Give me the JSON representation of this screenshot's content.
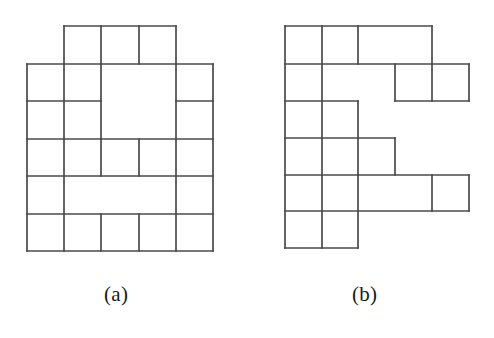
{
  "figure": {
    "kind": "polyomino-tiling-diagram",
    "background_color": "#ffffff",
    "line_color": "#4a4a4a",
    "line_width": 1.7,
    "panels": [
      {
        "id": "a",
        "caption": "(a)",
        "caption_x": 104,
        "caption_y": 282,
        "grid": {
          "cell_size": 37,
          "origin_x": 27,
          "origin_y": 26,
          "columns": 5,
          "rows": 6,
          "column_x": [
            27,
            64,
            101,
            139,
            176,
            213
          ],
          "row_y": [
            26,
            64,
            101,
            139,
            176,
            214,
            251
          ]
        },
        "occupied_cells": [
          [
            0,
            1
          ],
          [
            0,
            2
          ],
          [
            0,
            3
          ],
          [
            1,
            0
          ],
          [
            1,
            1
          ],
          [
            1,
            2
          ],
          [
            1,
            3
          ],
          [
            1,
            4
          ],
          [
            2,
            0
          ],
          [
            2,
            1
          ],
          [
            2,
            2
          ],
          [
            2,
            3
          ],
          [
            2,
            4
          ],
          [
            3,
            0
          ],
          [
            3,
            1
          ],
          [
            3,
            2
          ],
          [
            3,
            3
          ],
          [
            3,
            4
          ],
          [
            4,
            0
          ],
          [
            4,
            1
          ],
          [
            4,
            2
          ],
          [
            4,
            3
          ],
          [
            4,
            4
          ],
          [
            5,
            0
          ],
          [
            5,
            1
          ],
          [
            5,
            2
          ],
          [
            5,
            3
          ],
          [
            5,
            4
          ]
        ],
        "pieces": [
          {
            "name": "top-cell-c1",
            "cells": [
              [
                0,
                1
              ]
            ]
          },
          {
            "name": "top-cell-c2",
            "cells": [
              [
                0,
                2
              ]
            ]
          },
          {
            "name": "top-cell-c3",
            "cells": [
              [
                0,
                3
              ]
            ]
          },
          {
            "name": "left-square-r1c0",
            "cells": [
              [
                1,
                0
              ]
            ]
          },
          {
            "name": "left-square-r1c1",
            "cells": [
              [
                1,
                1
              ]
            ]
          },
          {
            "name": "big-square-r1r2-c2c3",
            "cells": [
              [
                1,
                2
              ],
              [
                1,
                3
              ],
              [
                2,
                2
              ],
              [
                2,
                3
              ]
            ]
          },
          {
            "name": "right-cell-r1c4",
            "cells": [
              [
                1,
                4
              ]
            ]
          },
          {
            "name": "left-square-r2c0",
            "cells": [
              [
                2,
                0
              ]
            ]
          },
          {
            "name": "left-square-r2c1",
            "cells": [
              [
                2,
                1
              ]
            ]
          },
          {
            "name": "right-cell-r2c4",
            "cells": [
              [
                2,
                4
              ]
            ]
          },
          {
            "name": "row3-cell-c0",
            "cells": [
              [
                3,
                0
              ]
            ]
          },
          {
            "name": "row3-cell-c1",
            "cells": [
              [
                3,
                1
              ]
            ]
          },
          {
            "name": "row3-cell-c2",
            "cells": [
              [
                3,
                2
              ]
            ]
          },
          {
            "name": "row3-cell-c3",
            "cells": [
              [
                3,
                3
              ]
            ]
          },
          {
            "name": "row3-cell-c4",
            "cells": [
              [
                3,
                4
              ]
            ]
          },
          {
            "name": "row4-cell-c0",
            "cells": [
              [
                4,
                0
              ]
            ]
          },
          {
            "name": "row4-tromino-c1c2c3",
            "cells": [
              [
                4,
                1
              ],
              [
                4,
                2
              ],
              [
                4,
                3
              ]
            ]
          },
          {
            "name": "row4-cell-c4",
            "cells": [
              [
                4,
                4
              ]
            ]
          },
          {
            "name": "row5-cell-c0",
            "cells": [
              [
                5,
                0
              ]
            ]
          },
          {
            "name": "row5-cell-c1",
            "cells": [
              [
                5,
                1
              ]
            ]
          },
          {
            "name": "row5-cell-c2",
            "cells": [
              [
                5,
                2
              ]
            ]
          },
          {
            "name": "row5-cell-c3",
            "cells": [
              [
                5,
                3
              ]
            ]
          },
          {
            "name": "row5-cell-c4",
            "cells": [
              [
                5,
                4
              ]
            ]
          }
        ],
        "segments": [
          [
            64,
            26,
            176,
            26
          ],
          [
            64,
            26,
            64,
            64
          ],
          [
            101,
            26,
            101,
            64
          ],
          [
            139,
            26,
            139,
            64
          ],
          [
            176,
            26,
            176,
            64
          ],
          [
            27,
            64,
            213,
            64
          ],
          [
            27,
            64,
            27,
            251
          ],
          [
            213,
            64,
            213,
            251
          ],
          [
            64,
            64,
            64,
            139
          ],
          [
            101,
            64,
            101,
            139
          ],
          [
            176,
            64,
            176,
            251
          ],
          [
            27,
            101,
            101,
            101
          ],
          [
            176,
            101,
            213,
            101
          ],
          [
            27,
            139,
            213,
            139
          ],
          [
            64,
            139,
            64,
            251
          ],
          [
            101,
            139,
            101,
            176
          ],
          [
            139,
            139,
            139,
            176
          ],
          [
            27,
            176,
            213,
            176
          ],
          [
            27,
            214,
            213,
            214
          ],
          [
            101,
            214,
            101,
            251
          ],
          [
            139,
            214,
            139,
            251
          ],
          [
            27,
            251,
            213,
            251
          ]
        ]
      },
      {
        "id": "b",
        "caption": "(b)",
        "caption_x": 352,
        "caption_y": 282,
        "grid": {
          "cell_size": 37,
          "origin_x": 285,
          "origin_y": 26,
          "columns": 5,
          "rows": 6,
          "column_x": [
            285,
            322,
            358,
            395,
            432,
            469
          ],
          "row_y": [
            26,
            64,
            101,
            138,
            175,
            211,
            248
          ]
        },
        "occupied_cells": [
          [
            0,
            0
          ],
          [
            0,
            1
          ],
          [
            0,
            2
          ],
          [
            0,
            3
          ],
          [
            1,
            0
          ],
          [
            1,
            1
          ],
          [
            1,
            2
          ],
          [
            1,
            3
          ],
          [
            1,
            4
          ],
          [
            2,
            0
          ],
          [
            2,
            1
          ],
          [
            3,
            0
          ],
          [
            3,
            1
          ],
          [
            3,
            2
          ],
          [
            4,
            0
          ],
          [
            4,
            1
          ],
          [
            4,
            2
          ],
          [
            4,
            3
          ],
          [
            4,
            4
          ],
          [
            5,
            0
          ],
          [
            5,
            1
          ]
        ],
        "pieces": [
          {
            "name": "row0-cell-c0",
            "cells": [
              [
                0,
                0
              ]
            ]
          },
          {
            "name": "row0-cell-c1",
            "cells": [
              [
                0,
                1
              ]
            ]
          },
          {
            "name": "row0-domino-c2c3",
            "cells": [
              [
                0,
                2
              ],
              [
                0,
                3
              ]
            ]
          },
          {
            "name": "row1-domino-c0c1",
            "cells": [
              [
                1,
                0
              ],
              [
                1,
                1
              ]
            ]
          },
          {
            "name": "row1-cell-c3",
            "cells": [
              [
                1,
                3
              ]
            ]
          },
          {
            "name": "row1-cell-c4",
            "cells": [
              [
                1,
                4
              ]
            ]
          },
          {
            "name": "row2-cell-c0",
            "cells": [
              [
                2,
                0
              ]
            ]
          },
          {
            "name": "row2-cell-c1",
            "cells": [
              [
                2,
                1
              ]
            ]
          },
          {
            "name": "row3-cell-c0",
            "cells": [
              [
                3,
                0
              ]
            ]
          },
          {
            "name": "row3-cell-c1",
            "cells": [
              [
                3,
                1
              ]
            ]
          },
          {
            "name": "row3-cell-c2",
            "cells": [
              [
                3,
                2
              ]
            ]
          },
          {
            "name": "row4-cell-c0",
            "cells": [
              [
                4,
                0
              ]
            ]
          },
          {
            "name": "row4-cell-c1",
            "cells": [
              [
                4,
                1
              ]
            ]
          },
          {
            "name": "row4-domino-c2c3",
            "cells": [
              [
                4,
                2
              ],
              [
                4,
                3
              ]
            ]
          },
          {
            "name": "row4-cell-c4",
            "cells": [
              [
                4,
                4
              ]
            ]
          },
          {
            "name": "row5-cell-c0",
            "cells": [
              [
                5,
                0
              ]
            ]
          },
          {
            "name": "row5-cell-c1",
            "cells": [
              [
                5,
                1
              ]
            ]
          }
        ],
        "segments": [
          [
            285,
            26,
            432,
            26
          ],
          [
            285,
            26,
            285,
            248
          ],
          [
            322,
            26,
            322,
            248
          ],
          [
            358,
            26,
            358,
            64
          ],
          [
            432,
            26,
            432,
            64
          ],
          [
            285,
            64,
            469,
            64
          ],
          [
            395,
            64,
            395,
            101
          ],
          [
            432,
            64,
            432,
            101
          ],
          [
            469,
            64,
            469,
            101
          ],
          [
            395,
            101,
            469,
            101
          ],
          [
            285,
            101,
            358,
            101
          ],
          [
            358,
            101,
            358,
            175
          ],
          [
            285,
            138,
            395,
            138
          ],
          [
            395,
            138,
            395,
            175
          ],
          [
            285,
            175,
            469,
            175
          ],
          [
            432,
            175,
            432,
            211
          ],
          [
            469,
            175,
            469,
            211
          ],
          [
            285,
            211,
            469,
            211
          ],
          [
            358,
            175,
            358,
            248
          ],
          [
            285,
            248,
            358,
            248
          ]
        ]
      }
    ]
  }
}
